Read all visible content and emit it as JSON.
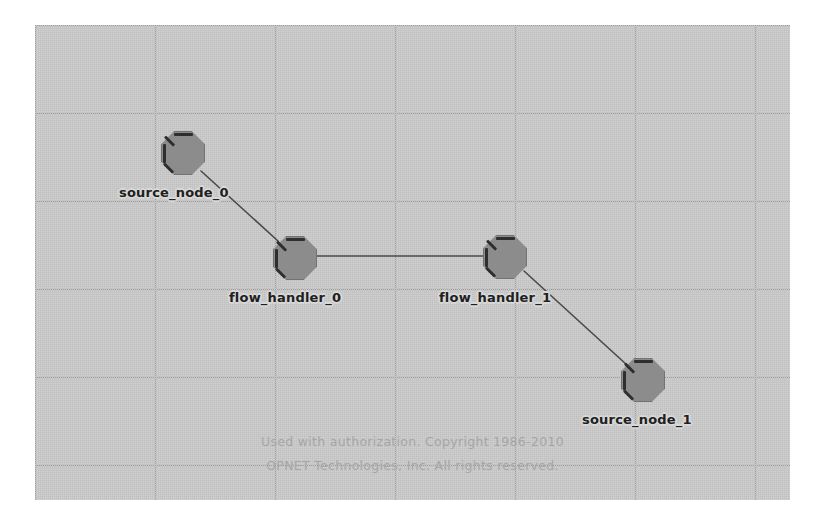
{
  "canvas": {
    "background_color": "#c9c9c9",
    "grid_color": "#9d9d9d",
    "grid_spacing_x": 120,
    "grid_spacing_y": 88,
    "x": 35,
    "y": 25,
    "width": 755,
    "height": 475
  },
  "nodes": [
    {
      "id": "source_node_0",
      "label": "source_node_0",
      "cx": 148,
      "cy": 128,
      "label_x": 84,
      "label_y": 160
    },
    {
      "id": "flow_handler_0",
      "label": "flow_handler_0",
      "cx": 260,
      "cy": 233,
      "label_x": 194,
      "label_y": 265
    },
    {
      "id": "flow_handler_1",
      "label": "flow_handler_1",
      "cx": 470,
      "cy": 232,
      "label_x": 404,
      "label_y": 265
    },
    {
      "id": "source_node_1",
      "label": "source_node_1",
      "cx": 608,
      "cy": 355,
      "label_x": 547,
      "label_y": 387
    }
  ],
  "node_style": {
    "shape": "octagon",
    "fill_color": "#8c8c8c",
    "bevel_color": "#2e2e2e",
    "size": 44
  },
  "links": [
    {
      "id": "link-source_node_0-flow_handler_0",
      "from": "source_node_0",
      "to": "flow_handler_0",
      "x1": 166,
      "y1": 146,
      "x2": 243,
      "y2": 216
    },
    {
      "id": "link-flow_handler_0-flow_handler_1",
      "from": "flow_handler_0",
      "to": "flow_handler_1",
      "x1": 282,
      "y1": 231,
      "x2": 448,
      "y2": 231
    },
    {
      "id": "link-flow_handler_1-source_node_1",
      "from": "flow_handler_1",
      "to": "source_node_1",
      "x1": 489,
      "y1": 246,
      "x2": 592,
      "y2": 340
    }
  ],
  "link_style": {
    "color": "#4a4a4a",
    "width": 1.6
  },
  "watermark": {
    "line1": "Used with authorization. Copyright 1986-2010",
    "line2": "OPNET Technologies, Inc.  All rights reserved.",
    "color": "#a6a6a6"
  }
}
